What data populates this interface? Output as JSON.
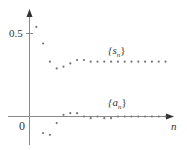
{
  "chart_data": {
    "type": "scatter",
    "title": "",
    "xlabel": "n",
    "ylabel": "",
    "y_ticks": [
      {
        "value": 0.5,
        "label": "0.5"
      }
    ],
    "origin_label": "0",
    "grid": false,
    "ylim": [
      -0.17,
      0.63
    ],
    "xlim": [
      0,
      21
    ],
    "series": [
      {
        "name": "{s_n}",
        "label": "{s",
        "subscript": "n",
        "label_close": "}",
        "x": [
          1,
          2,
          3,
          4,
          5,
          6,
          7,
          8,
          9,
          10,
          11,
          12,
          13,
          14,
          15,
          16,
          17,
          18,
          19,
          20
        ],
        "values": [
          0.54,
          0.44,
          0.33,
          0.29,
          0.3,
          0.32,
          0.34,
          0.34,
          0.33,
          0.33,
          0.33,
          0.33,
          0.33,
          0.33,
          0.33,
          0.33,
          0.33,
          0.33,
          0.33,
          0.33
        ]
      },
      {
        "name": "{a_n}",
        "label": "{a",
        "subscript": "n",
        "label_close": "}",
        "x": [
          1,
          2,
          3,
          4,
          5,
          6,
          7,
          8,
          9,
          10,
          11,
          12,
          13,
          14,
          15,
          16,
          17,
          18,
          19,
          20
        ],
        "values": [
          0.54,
          -0.1,
          -0.11,
          -0.04,
          0.01,
          0.02,
          0.02,
          0.0,
          -0.01,
          0.0,
          -0.01,
          -0.01,
          0.0,
          0.0,
          0.0,
          0.0,
          0.0,
          0.0,
          0.0,
          0.0
        ]
      }
    ]
  },
  "colors": {
    "axis": "#8a8a8a",
    "point": "#777777",
    "text": "#333333"
  }
}
